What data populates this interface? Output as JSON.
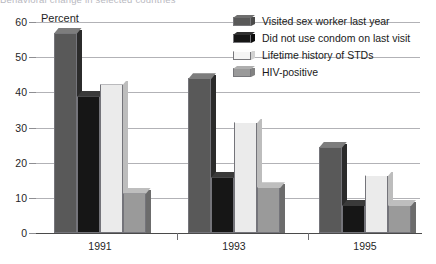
{
  "clipped_title": "Behavioral change in selected countries",
  "chart_data": {
    "type": "bar",
    "title": "",
    "xlabel": "",
    "ylabel": "Percent",
    "categories": [
      "1991",
      "1993",
      "1995"
    ],
    "yticks": [
      0,
      10,
      20,
      30,
      40,
      50,
      60
    ],
    "ylim": [
      0,
      60
    ],
    "grid": true,
    "legend_position": "top-right",
    "series": [
      {
        "name": "Visited sex worker last year",
        "color": "#595959",
        "values": [
          57,
          44,
          24.5
        ]
      },
      {
        "name": "Did not use condom on last visit",
        "color": "#161616",
        "values": [
          39,
          16,
          8
        ]
      },
      {
        "name": "Lifetime history of STDs",
        "color": "#ebebeb",
        "values": [
          42.5,
          31.5,
          16.5
        ]
      },
      {
        "name": "HIV-positive",
        "color": "#9a9a9a",
        "values": [
          11.5,
          13,
          8
        ]
      }
    ]
  }
}
